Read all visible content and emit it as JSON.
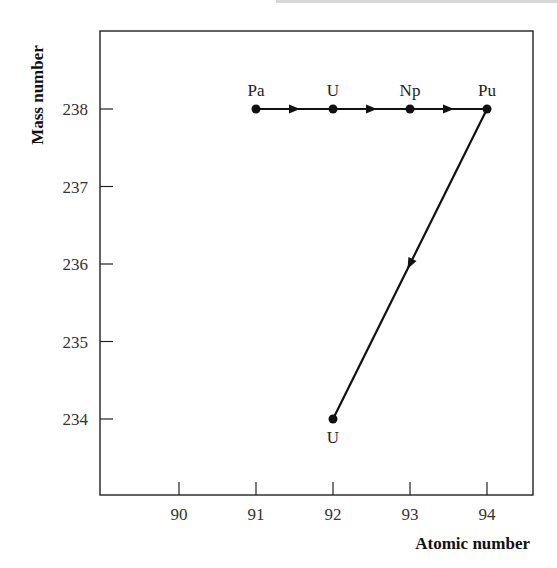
{
  "chart_data": {
    "type": "line",
    "title": "",
    "xlabel": "Atomic number",
    "ylabel": "Mass number",
    "xlim": [
      88.9,
      94.6
    ],
    "ylim": [
      233.0,
      239.0
    ],
    "xticks": [
      90,
      91,
      92,
      93,
      94
    ],
    "yticks": [
      234,
      235,
      236,
      237,
      238
    ],
    "grid": false,
    "legend": null,
    "points": [
      {
        "label": "Pa",
        "x": 91,
        "y": 238,
        "label_pos": "above"
      },
      {
        "label": "U",
        "x": 92,
        "y": 238,
        "label_pos": "above"
      },
      {
        "label": "Np",
        "x": 93,
        "y": 238,
        "label_pos": "above"
      },
      {
        "label": "Pu",
        "x": 94,
        "y": 238,
        "label_pos": "above"
      },
      {
        "label": "U",
        "x": 92,
        "y": 234,
        "label_pos": "below"
      }
    ],
    "path": [
      {
        "x": 91,
        "y": 238
      },
      {
        "x": 92,
        "y": 238
      },
      {
        "x": 93,
        "y": 238
      },
      {
        "x": 94,
        "y": 238
      },
      {
        "x": 92,
        "y": 234
      }
    ],
    "annotations": "Decay chain: Pa-238 → U-238 → Np-238 → Pu-238 (beta decays), then Pu-238 → U-234 (alpha decay)"
  },
  "colors": {
    "line": "#111111",
    "axis": "#222222",
    "text": "#333333"
  }
}
